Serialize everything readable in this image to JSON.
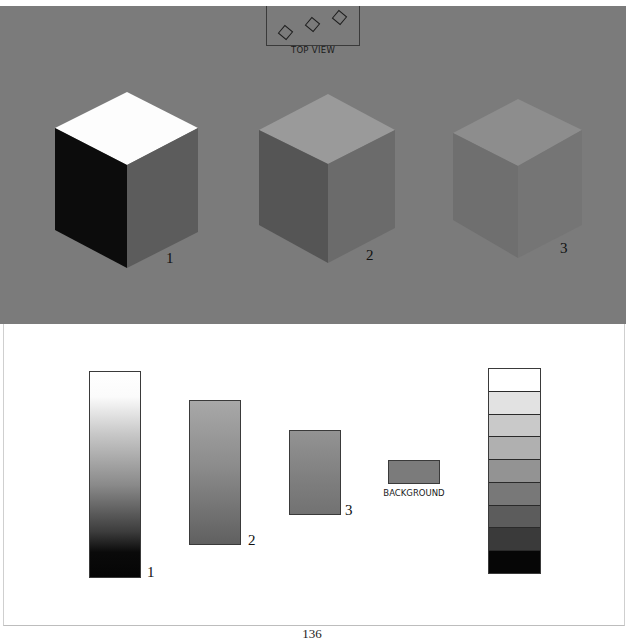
{
  "top_view": {
    "label": "TOP VIEW",
    "diamonds": [
      {
        "x": 280,
        "y": 27
      },
      {
        "x": 307,
        "y": 19
      },
      {
        "x": 334,
        "y": 12
      }
    ]
  },
  "colors": {
    "panel_background": "#7b7b7b",
    "bar_border": "#3a3a3a"
  },
  "cubes": [
    {
      "label": "1",
      "faces": {
        "top": "#fdfdfd",
        "left": "#0c0c0c",
        "right": "#5c5c5c"
      },
      "points": {
        "top": [
          127,
          92
        ],
        "left": [
          55,
          128
        ],
        "center": [
          127,
          165
        ],
        "right": [
          198,
          128
        ],
        "bottom": [
          127,
          268
        ],
        "bottom_left": [
          55,
          230
        ],
        "bottom_right": [
          198,
          232
        ]
      },
      "label_pos": [
        166,
        251
      ]
    },
    {
      "label": "2",
      "faces": {
        "top": "#9a9a9a",
        "left": "#555555",
        "right": "#6b6b6b"
      },
      "points": {
        "top": [
          328,
          94
        ],
        "left": [
          259,
          130
        ],
        "center": [
          328,
          164
        ],
        "right": [
          395,
          130
        ],
        "bottom": [
          328,
          263
        ],
        "bottom_left": [
          259,
          225
        ],
        "bottom_right": [
          395,
          228
        ]
      },
      "label_pos": [
        366,
        248
      ]
    },
    {
      "label": "3",
      "faces": {
        "top": "#8d8d8d",
        "left": "#6f6f6f",
        "right": "#757575"
      },
      "points": {
        "top": [
          518,
          99
        ],
        "left": [
          453,
          133
        ],
        "center": [
          518,
          166
        ],
        "right": [
          582,
          130
        ],
        "bottom": [
          518,
          258
        ],
        "bottom_left": [
          453,
          220
        ],
        "bottom_right": [
          582,
          225
        ]
      },
      "label_pos": [
        560,
        241
      ]
    }
  ],
  "bars": [
    {
      "label": "1",
      "x": 89,
      "y": 371,
      "w": 52,
      "h": 207,
      "gradient": [
        "#ffffff 0%",
        "#fbfbfb 12%",
        "#c8c8c8 30%",
        "#8a8a8a 55%",
        "#3c3c3c 78%",
        "#0a0a0a 88%",
        "#050505 100%"
      ],
      "label_pos": [
        147,
        565
      ]
    },
    {
      "label": "2",
      "x": 189,
      "y": 400,
      "w": 52,
      "h": 145,
      "gradient": [
        "#a8a8a8 0%",
        "#8c8c8c 45%",
        "#606060 100%"
      ],
      "label_pos": [
        248,
        533
      ]
    },
    {
      "label": "3",
      "x": 289,
      "y": 430,
      "w": 52,
      "h": 85,
      "gradient": [
        "#939393 0%",
        "#7e7e7e 60%",
        "#727272 100%"
      ],
      "label_pos": [
        345,
        503
      ]
    }
  ],
  "background_swatch": {
    "label": "BACKGROUND",
    "x": 388,
    "y": 460,
    "w": 52,
    "h": 24,
    "color": "#7b7b7b"
  },
  "value_scale": {
    "steps": [
      "#ffffff",
      "#e2e2e2",
      "#c9c9c9",
      "#b0b0b0",
      "#939393",
      "#787878",
      "#5c5c5c",
      "#3a3a3a",
      "#060606"
    ]
  },
  "page_number": "136"
}
